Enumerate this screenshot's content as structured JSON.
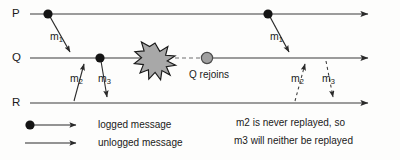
{
  "figure": {
    "type": "message-logging-timeline-diagram",
    "background_color": "#fdfdfc",
    "ink_color": "#1a1a1a",
    "line_color": "#3a3a3a",
    "crash_fill_color": "#a8a8a8",
    "rejoin_fill_color": "#a0a0a0"
  },
  "processes": [
    {
      "id": "P",
      "label": "P",
      "axis_y": 14
    },
    {
      "id": "Q",
      "label": "Q",
      "axis_y": 58
    },
    {
      "id": "R",
      "label": "R",
      "axis_y": 103
    }
  ],
  "messages": {
    "m1_first": "m",
    "m1_first_sub": "1",
    "m2_first": "m",
    "m2_first_sub": "2",
    "m3_first": "m",
    "m3_first_sub": "3",
    "m1_second": "m",
    "m1_second_sub": "1",
    "m2_second": "m",
    "m2_second_sub": "2",
    "m3_second": "m",
    "m3_second_sub": "3"
  },
  "events": {
    "crash_marker": "crash-starburst",
    "rejoin_label": "Q rejoins"
  },
  "legend": {
    "logged": "logged message",
    "unlogged": "unlogged message"
  },
  "annotation": {
    "line1": "m2 is never replayed, so",
    "line2": "m3 will neither be replayed"
  }
}
